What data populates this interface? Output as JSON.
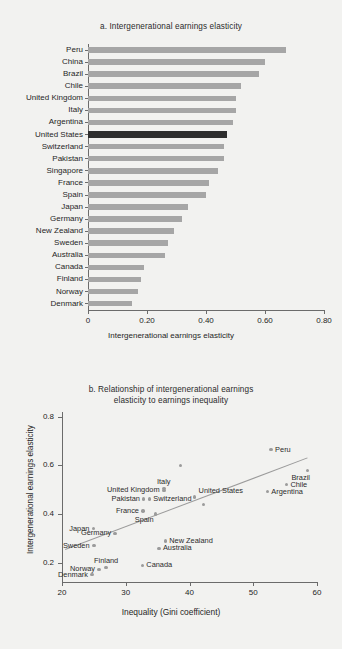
{
  "figure": {
    "background_color": "#f2f2f0",
    "bar_color": "#a6a6a6",
    "highlight_color": "#2e2e2e",
    "dot_color": "#9b9b9b",
    "trend_color": "#9b9b9b"
  },
  "chart_data": [
    {
      "type": "bar",
      "id": "panel-a",
      "title": "a.  Intergenerational earnings elasticity",
      "orientation": "horizontal",
      "xlabel": "Intergenerational earnings elasticity",
      "ylabel": "",
      "xlim": [
        0,
        0.8
      ],
      "xticks": [
        0,
        0.2,
        0.4,
        0.6,
        0.8
      ],
      "xticklabels": [
        "0",
        "0.20",
        "0.40",
        "0.60",
        "0.80"
      ],
      "grid": false,
      "legend": "none",
      "highlight_category": "United States",
      "categories": [
        "Peru",
        "China",
        "Brazil",
        "Chile",
        "United Kingdom",
        "Italy",
        "Argentina",
        "United States",
        "Switzerland",
        "Pakistan",
        "Singapore",
        "France",
        "Spain",
        "Japan",
        "Germany",
        "New Zealand",
        "Sweden",
        "Australia",
        "Canada",
        "Finland",
        "Norway",
        "Denmark"
      ],
      "values": [
        0.67,
        0.6,
        0.58,
        0.52,
        0.5,
        0.5,
        0.49,
        0.47,
        0.46,
        0.46,
        0.44,
        0.41,
        0.4,
        0.34,
        0.32,
        0.29,
        0.27,
        0.26,
        0.19,
        0.18,
        0.17,
        0.15
      ]
    },
    {
      "type": "scatter",
      "id": "panel-b",
      "title_line1": "b.  Relationship of intergenerational earnings",
      "title_line2": "elasticity to earnings inequality",
      "xlabel": "Inequality (Gini coefficient)",
      "ylabel": "Intergenerational earnings elasticity",
      "xlim": [
        20,
        60
      ],
      "ylim": [
        0.12,
        0.82
      ],
      "xticks": [
        20,
        30,
        40,
        50,
        60
      ],
      "xticklabels": [
        "20",
        "30",
        "40",
        "50",
        "60"
      ],
      "yticks": [
        0.2,
        0.4,
        0.6,
        0.8
      ],
      "yticklabels": [
        "0.2",
        "0.4",
        "0.6",
        "0.8"
      ],
      "grid": false,
      "legend": "none",
      "trendline": {
        "x0": 20.5,
        "y0": 0.255,
        "x1": 58.5,
        "y1": 0.632
      },
      "points": [
        {
          "label": "Peru",
          "x": 52.8,
          "y": 0.665,
          "label_pos": "right"
        },
        {
          "label": "Brazil",
          "x": 58.5,
          "y": 0.578,
          "label_pos": "below-right"
        },
        {
          "label": "Chile",
          "x": 55.2,
          "y": 0.521,
          "label_pos": "right"
        },
        {
          "label": "Argentina",
          "x": 52.2,
          "y": 0.492,
          "label_pos": "right"
        },
        {
          "label": "Italy",
          "x": 36.0,
          "y": 0.506,
          "label_pos": "above"
        },
        {
          "label": "United Kingdom",
          "x": 36.0,
          "y": 0.497,
          "label_pos": "left"
        },
        {
          "label": "United States",
          "x": 40.8,
          "y": 0.47,
          "label_pos": "above-right"
        },
        {
          "label": "Switzerland",
          "x": 33.7,
          "y": 0.462,
          "label_pos": "right"
        },
        {
          "label": "Pakistan",
          "x": 32.8,
          "y": 0.462,
          "label_pos": "left"
        },
        {
          "label": "",
          "x": 42.2,
          "y": 0.44,
          "label_pos": "none"
        },
        {
          "label": "",
          "x": 38.6,
          "y": 0.6,
          "label_pos": "none"
        },
        {
          "label": "France",
          "x": 32.7,
          "y": 0.413,
          "label_pos": "left"
        },
        {
          "label": "Spain",
          "x": 34.7,
          "y": 0.4,
          "label_pos": "below-left"
        },
        {
          "label": "Japan",
          "x": 24.9,
          "y": 0.34,
          "label_pos": "left"
        },
        {
          "label": "Germany",
          "x": 28.3,
          "y": 0.32,
          "label_pos": "left"
        },
        {
          "label": "Sweden",
          "x": 25.0,
          "y": 0.27,
          "label_pos": "left"
        },
        {
          "label": "New Zealand",
          "x": 36.2,
          "y": 0.289,
          "label_pos": "right"
        },
        {
          "label": "Australia",
          "x": 35.2,
          "y": 0.258,
          "label_pos": "right"
        },
        {
          "label": "Finland",
          "x": 26.9,
          "y": 0.18,
          "label_pos": "above"
        },
        {
          "label": "Norway",
          "x": 25.8,
          "y": 0.172,
          "label_pos": "left"
        },
        {
          "label": "Canada",
          "x": 32.6,
          "y": 0.188,
          "label_pos": "right"
        },
        {
          "label": "Denmark",
          "x": 24.7,
          "y": 0.15,
          "label_pos": "left"
        }
      ]
    }
  ]
}
